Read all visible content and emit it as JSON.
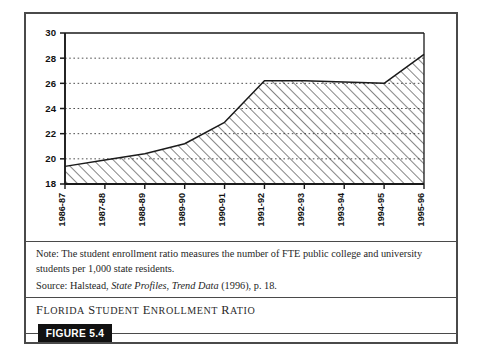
{
  "figure": {
    "tag_label": "FIGURE 5.4",
    "caption": "FLORIDA STUDENT ENROLLMENT RATIO",
    "caption_first_word": "F",
    "caption_rest": "LORIDA ",
    "note_label": "Note:",
    "note_text": "Note: The student enrollment ratio measures the number of FTE public college and university students per 1,000 state residents.",
    "source_prefix": "Source: Halstead, ",
    "source_italic_1": "State Profiles",
    "source_sep": ", ",
    "source_italic_2": "Trend Data",
    "source_suffix": " (1996), p. 18."
  },
  "chart_data": {
    "type": "area",
    "title": "Florida Student Enrollment Ratio",
    "xlabel": "",
    "ylabel": "",
    "categories": [
      "1986-87",
      "1987-88",
      "1988-89",
      "1989-90",
      "1990-91",
      "1991-92",
      "1992-93",
      "1993-94",
      "1994-95",
      "1995-96"
    ],
    "values": [
      19.4,
      19.9,
      20.4,
      21.2,
      22.9,
      26.2,
      26.2,
      26.1,
      26.0,
      28.3
    ],
    "ylim": [
      18,
      30
    ],
    "yticks": [
      18,
      20,
      22,
      24,
      26,
      28,
      30
    ],
    "ytick_labels": [
      "18",
      "20",
      "22",
      "24",
      "26",
      "28",
      "30"
    ],
    "grid": true,
    "grid_style": "dotted-horizontal",
    "legend": "none",
    "fill": "diagonal-hatch",
    "line_color": "#1a1a1a",
    "grid_color": "#555555",
    "axis_color": "#1a1a1a"
  },
  "colors": {
    "frame": "#4a4a4a",
    "ink": "#1a1a1a",
    "tag_background": "#111111",
    "tag_text": "#ffffff",
    "page_background": "#ffffff"
  }
}
